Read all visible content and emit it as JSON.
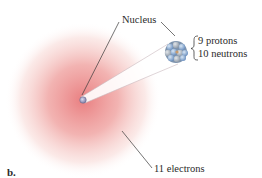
{
  "figure": {
    "panel_label": "b.",
    "labels": {
      "nucleus": "Nucleus",
      "protons": "9 protons",
      "neutrons": "10 neutrons",
      "electrons": "11 electrons"
    },
    "colors": {
      "electron_cloud_center": "#e8787a",
      "electron_cloud_edge": "#ffffff",
      "nucleus_particle_blue": "#7fa6cf",
      "nucleus_particle_grey": "#9aa6b4",
      "beam": "#ffffff",
      "leader_line": "#3a3a3a"
    }
  }
}
